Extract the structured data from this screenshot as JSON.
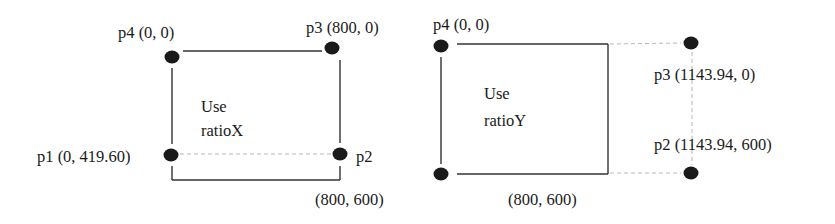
{
  "diagrams": [
    {
      "name": "ratioX",
      "caption": [
        "Use",
        "ratioX"
      ],
      "points": {
        "p4": "p4 (0, 0)",
        "p3": "p3 (800, 0)",
        "p1": "p1 (0, 419.60)",
        "p2": "p2",
        "corner": "(800, 600)"
      }
    },
    {
      "name": "ratioY",
      "caption": [
        "Use",
        "ratioY"
      ],
      "points": {
        "p4": "p4 (0, 0)",
        "p3": "p3 (1143.94, 0)",
        "p2": "p2 (1143.94, 600)",
        "corner": "(800, 600)"
      }
    }
  ],
  "colors": {
    "line": "#333333",
    "dashed": "#b8b8b8",
    "dot": "#1a1a1a",
    "text": "#1a1a1a"
  }
}
